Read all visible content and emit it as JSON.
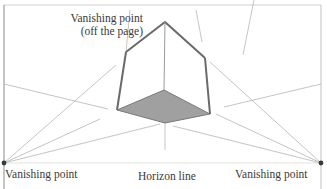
{
  "labels": {
    "vp_top_line1": "Vanishing point",
    "vp_top_line2": "(off the page)",
    "vp_left": "Vanishing point",
    "vp_right": "Vanishing point",
    "horizon": "Horizon line"
  },
  "colors": {
    "background": "#ffffff",
    "frame": "#c8c8c8",
    "guide_line": "#b0b0b0",
    "cube_edge": "#6a6a6a",
    "cube_base_fill": "#9a9a9a",
    "vanishing_point": "#3a3a3a",
    "text": "#3a3a3a"
  },
  "geometry": {
    "horizon_y": 163,
    "vp_left": [
      4,
      163
    ],
    "vp_right": [
      321,
      163
    ],
    "cube": {
      "top_apex": [
        165,
        22
      ],
      "top_left": [
        126,
        52
      ],
      "top_right": [
        205,
        58
      ],
      "bottom_left": [
        117,
        110
      ],
      "bottom_right": [
        210,
        114
      ],
      "bottom_front": [
        165,
        123
      ],
      "bottom_back": [
        164,
        90
      ]
    }
  }
}
